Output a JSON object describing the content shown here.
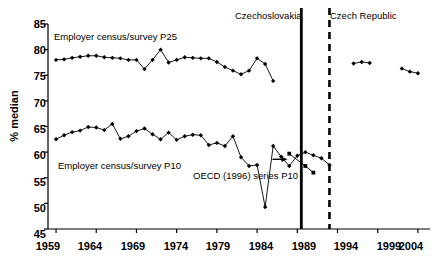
{
  "chart_data": {
    "type": "line",
    "title": "",
    "subtitle": "",
    "xlabel": "",
    "ylabel": "% median",
    "xlim": [
      1958.0,
      2005.5
    ],
    "ylim": [
      45,
      85
    ],
    "grid": false,
    "legend_position": "inline-annotations",
    "xticks": [
      1959,
      1964,
      1969,
      1974,
      1979,
      1984,
      1989,
      1994,
      1999,
      2004
    ],
    "yticks": [
      45,
      50,
      55,
      60,
      65,
      70,
      75,
      80,
      85
    ],
    "xtick_labels": [
      "1959",
      "1964",
      "1969",
      "1974",
      "1979",
      "1984",
      "1989",
      "1994",
      "1999",
      "2004"
    ],
    "ytick_labels": [
      "45",
      "50",
      "55",
      "60",
      "65",
      "70",
      "75",
      "80",
      "85"
    ],
    "series": [
      {
        "name": "Employer census/survey P25",
        "label": "Employer census/survey P25",
        "marker": "diamond",
        "color": "#000000",
        "points": [
          [
            1959,
            78.0
          ],
          [
            1960,
            78.1
          ],
          [
            1961,
            78.4
          ],
          [
            1962,
            78.6
          ],
          [
            1963,
            78.8
          ],
          [
            1964,
            78.8
          ],
          [
            1965,
            78.5
          ],
          [
            1966,
            78.4
          ],
          [
            1967,
            78.3
          ],
          [
            1968,
            78.0
          ],
          [
            1969,
            78.0
          ],
          [
            1970,
            76.2
          ],
          [
            1971,
            78.0
          ],
          [
            1972,
            80.0
          ],
          [
            1973,
            77.5
          ],
          [
            1974,
            78.0
          ],
          [
            1975,
            78.5
          ],
          [
            1976,
            78.4
          ],
          [
            1977,
            78.3
          ],
          [
            1978,
            78.3
          ],
          [
            1979,
            77.6
          ],
          [
            1980,
            76.6
          ],
          [
            1981,
            75.9
          ],
          [
            1982,
            75.2
          ],
          [
            1983,
            75.9
          ],
          [
            1984,
            78.3
          ],
          [
            1985,
            77.2
          ],
          [
            1986,
            73.9
          ]
        ]
      },
      {
        "name": "Employer census/survey P25 (Czech Republic 1996-1998)",
        "label": "",
        "marker": "diamond",
        "color": "#000000",
        "points": [
          [
            1996,
            77.3
          ],
          [
            1997,
            77.6
          ],
          [
            1998,
            77.4
          ]
        ]
      },
      {
        "name": "Employer census/survey P25 (Czech Republic 2002-2004)",
        "label": "",
        "marker": "diamond",
        "color": "#000000",
        "points": [
          [
            2002,
            76.3
          ],
          [
            2003,
            75.7
          ],
          [
            2004,
            75.4
          ]
        ]
      },
      {
        "name": "Employer census/survey P10",
        "label": "Employer census/survey P10",
        "marker": "diamond",
        "color": "#000000",
        "points": [
          [
            1959,
            62.5
          ],
          [
            1960,
            63.3
          ],
          [
            1961,
            63.9
          ],
          [
            1962,
            64.2
          ],
          [
            1963,
            64.9
          ],
          [
            1964,
            64.8
          ],
          [
            1965,
            64.3
          ],
          [
            1966,
            65.5
          ],
          [
            1967,
            62.6
          ],
          [
            1968,
            63.1
          ],
          [
            1969,
            64.1
          ],
          [
            1970,
            64.6
          ],
          [
            1971,
            63.5
          ],
          [
            1972,
            62.5
          ],
          [
            1973,
            63.8
          ],
          [
            1974,
            62.4
          ],
          [
            1975,
            63.1
          ],
          [
            1976,
            63.4
          ],
          [
            1977,
            63.3
          ],
          [
            1978,
            61.4
          ],
          [
            1979,
            61.8
          ],
          [
            1980,
            61.2
          ],
          [
            1981,
            63.1
          ],
          [
            1982,
            59.0
          ],
          [
            1983,
            57.3
          ],
          [
            1984,
            57.5
          ],
          [
            1985,
            49.3
          ],
          [
            1986,
            61.2
          ],
          [
            1987,
            59.1
          ],
          [
            1988,
            57.3
          ],
          [
            1989,
            59.3
          ],
          [
            1990,
            60.0
          ],
          [
            1991,
            59.4
          ],
          [
            1992,
            58.8
          ],
          [
            1993,
            57.5
          ]
        ]
      },
      {
        "name": "OECD (1996) series P10",
        "label": "OECD (1996) series P10",
        "marker": "square",
        "color": "#000000",
        "points": [
          [
            1988,
            59.7
          ],
          [
            1990,
            57.3
          ],
          [
            1991,
            56.0
          ]
        ]
      }
    ],
    "annotations": [
      {
        "text": "Czechoslovakia",
        "type": "era-label"
      },
      {
        "text": "Czech Republic",
        "type": "era-label"
      },
      {
        "text": "Employer census/survey P25",
        "type": "series-label"
      },
      {
        "text": "Employer census/survey P10",
        "type": "series-label"
      },
      {
        "text": "OECD (1996) series P10",
        "type": "series-label"
      }
    ],
    "vertical_lines": [
      {
        "x": 1989.5,
        "style": "solid",
        "label": "Czechoslovakia end"
      },
      {
        "x": 1993.0,
        "style": "dashed",
        "label": "Czech Republic start"
      }
    ]
  },
  "axis": {
    "ylabel": "% median",
    "ytick_45": "45",
    "ytick_50": "50",
    "ytick_55": "55",
    "ytick_60": "60",
    "ytick_65": "65",
    "ytick_70": "70",
    "ytick_75": "75",
    "ytick_80": "80",
    "ytick_85": "85",
    "xtick_1959": "1959",
    "xtick_1964": "1964",
    "xtick_1969": "1969",
    "xtick_1974": "1974",
    "xtick_1979": "1979",
    "xtick_1984": "1984",
    "xtick_1989": "1989",
    "xtick_1994": "1994",
    "xtick_1999": "1999",
    "xtick_2004": "2004"
  },
  "labels": {
    "era_czechoslovakia": "Czechoslovakia",
    "era_czech_republic": "Czech Republic",
    "series_p25": "Employer census/survey P25",
    "series_p10": "Employer census/survey P10",
    "series_oecd_p10": "OECD (1996) series P10"
  }
}
